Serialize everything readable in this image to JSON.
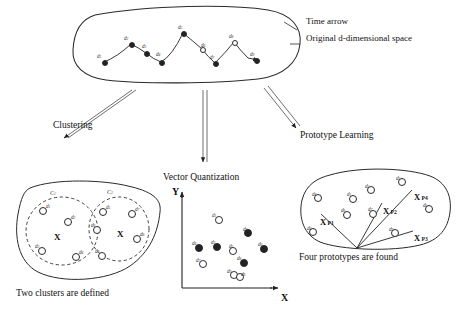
{
  "figure": {
    "background": "#ffffff",
    "ink": "#1a1a1a"
  },
  "top_panel": {
    "name": "original-space-blob",
    "annotations": [
      {
        "id": "time-arrow",
        "text": "Time arrow",
        "x": 306,
        "y": 21
      },
      {
        "id": "original-space",
        "text": "Original d-dimensional space",
        "x": 306,
        "y": 38
      }
    ],
    "trajectory_points": [
      {
        "label": "d",
        "sub": "1",
        "x": 104,
        "y": 62,
        "lx": 97,
        "ly": 53,
        "filled": true
      },
      {
        "label": "d",
        "sub": "2",
        "x": 131,
        "y": 44,
        "lx": 124,
        "ly": 35,
        "filled": true
      },
      {
        "label": "d",
        "sub": "3",
        "x": 146,
        "y": 53,
        "lx": 142,
        "ly": 43,
        "filled": true
      },
      {
        "label": "d",
        "sub": "4",
        "x": 161,
        "y": 62,
        "lx": 156,
        "ly": 51,
        "filled": true
      },
      {
        "label": "d",
        "sub": "5",
        "x": 183,
        "y": 33,
        "lx": 178,
        "ly": 24,
        "filled": true
      },
      {
        "label": "d",
        "sub": "6",
        "x": 202,
        "y": 49,
        "lx": 201,
        "ly": 42,
        "filled": false
      },
      {
        "label": "d",
        "sub": "7",
        "x": 215,
        "y": 63,
        "lx": 210,
        "ly": 54,
        "filled": true
      },
      {
        "label": "d",
        "sub": "8",
        "x": 234,
        "y": 42,
        "lx": 229,
        "ly": 33,
        "filled": false
      },
      {
        "label": "d",
        "sub": "9",
        "x": 256,
        "y": 60,
        "lx": 250,
        "ly": 51,
        "filled": true
      }
    ]
  },
  "branches": [
    {
      "id": "clustering",
      "label": "Clustering",
      "lx": 53,
      "ly": 120
    },
    {
      "id": "vector-quantization",
      "label": "Vector Quantization",
      "lx": 163,
      "ly": 172
    },
    {
      "id": "prototype-learning",
      "label": "Prototype Learning",
      "lx": 300,
      "ly": 135
    }
  ],
  "clustering_panel": {
    "caption": "Two clusters are defined",
    "caption_x": 16,
    "caption_y": 290,
    "cluster_labels": [
      {
        "text": "C",
        "sub": "1",
        "x": 50,
        "y": 190
      },
      {
        "text": "C",
        "sub": "2",
        "x": 107,
        "y": 189
      }
    ],
    "centroids": [
      {
        "mark": "X",
        "x": 54,
        "y": 232
      },
      {
        "mark": "X",
        "x": 117,
        "y": 229
      }
    ],
    "points": [
      {
        "label": "d",
        "sub": "1",
        "x": 42,
        "y": 210,
        "lx": 46,
        "ly": 203
      },
      {
        "label": "d",
        "sub": "2",
        "x": 67,
        "y": 221,
        "lx": 71,
        "ly": 214
      },
      {
        "label": "d",
        "sub": "3",
        "x": 41,
        "y": 250,
        "lx": 35,
        "ly": 243
      },
      {
        "label": "d",
        "sub": "4",
        "x": 75,
        "y": 256,
        "lx": 79,
        "ly": 249
      },
      {
        "label": "d",
        "sub": "5",
        "x": 102,
        "y": 211,
        "lx": 106,
        "ly": 204
      },
      {
        "label": "d",
        "sub": "6",
        "x": 96,
        "y": 229,
        "lx": 91,
        "ly": 222
      },
      {
        "label": "d",
        "sub": "7",
        "x": 131,
        "y": 213,
        "lx": 135,
        "ly": 206
      },
      {
        "label": "d",
        "sub": "8",
        "x": 136,
        "y": 238,
        "lx": 140,
        "ly": 231
      },
      {
        "label": "d",
        "sub": "9",
        "x": 101,
        "y": 255,
        "lx": 95,
        "ly": 248
      }
    ]
  },
  "vq_panel": {
    "title": "Vector Quantization",
    "axis_x_label": "X",
    "axis_y_label": "Y",
    "axis_x_label_pos": {
      "x": 283,
      "y": 295
    },
    "axis_y_label_pos": {
      "x": 172,
      "y": 191
    },
    "points": [
      {
        "label": "d",
        "sub": "1",
        "x": 218,
        "y": 219,
        "lx": 212,
        "ly": 212,
        "filled": false
      },
      {
        "label": "d",
        "sub": "2",
        "x": 247,
        "y": 232,
        "lx": 243,
        "ly": 226,
        "filled": true
      },
      {
        "label": "d",
        "sub": "3",
        "x": 216,
        "y": 246,
        "lx": 211,
        "ly": 239,
        "filled": true
      },
      {
        "label": "d",
        "sub": "4",
        "x": 198,
        "y": 247,
        "lx": 192,
        "ly": 240,
        "filled": true
      },
      {
        "label": "d",
        "sub": "5",
        "x": 232,
        "y": 250,
        "lx": 229,
        "ly": 243,
        "filled": false
      },
      {
        "label": "d",
        "sub": "6",
        "x": 263,
        "y": 248,
        "lx": 258,
        "ly": 241,
        "filled": true
      },
      {
        "label": "d",
        "sub": "7",
        "x": 202,
        "y": 263,
        "lx": 196,
        "ly": 257,
        "filled": false
      },
      {
        "label": "d",
        "sub": "8",
        "x": 243,
        "y": 262,
        "lx": 237,
        "ly": 255,
        "filled": true
      },
      {
        "label": "d",
        "sub": "9",
        "x": 233,
        "y": 274,
        "lx": 227,
        "ly": 268,
        "filled": false
      },
      {
        "label": "d",
        "sub": "0",
        "x": 239,
        "y": 276,
        "lx": 241,
        "ly": 271,
        "filled": false
      }
    ]
  },
  "prototype_panel": {
    "caption": "Four prototypes are found",
    "caption_x": 299,
    "caption_y": 254,
    "prototypes": [
      {
        "mark": "X",
        "sub": "P1",
        "x": 320,
        "y": 217,
        "sub_x": 331,
        "sub_y": 224
      },
      {
        "mark": "X",
        "sub": "P2",
        "x": 383,
        "y": 206,
        "sub_x": 392,
        "sub_y": 210
      },
      {
        "mark": "X",
        "sub": "P3",
        "x": 414,
        "y": 233,
        "sub_x": 423,
        "sub_y": 237
      },
      {
        "mark": "X",
        "sub": "P4",
        "x": 414,
        "y": 192,
        "sub_x": 423,
        "sub_y": 196
      }
    ],
    "vertex": {
      "x": 357,
      "y": 248
    },
    "points": [
      {
        "label": "d",
        "sub": "1",
        "x": 352,
        "y": 198,
        "lx": 347,
        "ly": 191
      },
      {
        "label": "d",
        "sub": "2",
        "x": 370,
        "y": 189,
        "lx": 365,
        "ly": 183
      },
      {
        "label": "d",
        "sub": "3",
        "x": 401,
        "y": 181,
        "lx": 396,
        "ly": 175
      },
      {
        "label": "d",
        "sub": "4",
        "x": 317,
        "y": 197,
        "lx": 312,
        "ly": 191
      },
      {
        "label": "d",
        "sub": "5",
        "x": 428,
        "y": 208,
        "lx": 423,
        "ly": 202
      },
      {
        "label": "d",
        "sub": "6",
        "x": 346,
        "y": 214,
        "lx": 341,
        "ly": 207
      },
      {
        "label": "d",
        "sub": "7",
        "x": 372,
        "y": 213,
        "lx": 368,
        "ly": 206
      },
      {
        "label": "d",
        "sub": "8",
        "x": 312,
        "y": 231,
        "lx": 307,
        "ly": 225
      },
      {
        "label": "d",
        "sub": "9",
        "x": 394,
        "y": 232,
        "lx": 389,
        "ly": 226
      }
    ]
  }
}
